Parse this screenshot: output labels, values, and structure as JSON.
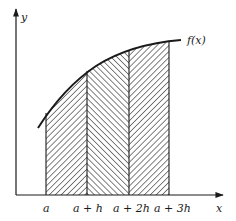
{
  "figure": {
    "axes": {
      "x_label": "x",
      "y_label": "y"
    },
    "curve_label": "f(x)",
    "tick_labels": [
      "a",
      "a + h",
      "a + 2h",
      "a + 3h"
    ],
    "strips": [
      {
        "from": "a",
        "to": "a + h",
        "hatch": "backslash"
      },
      {
        "from": "a + h",
        "to": "a + 2h",
        "hatch": "slash"
      },
      {
        "from": "a + 2h",
        "to": "a + 3h",
        "hatch": "backslash"
      }
    ],
    "colors": {
      "ink": "#1a1a1a",
      "background": "#ffffff"
    }
  }
}
